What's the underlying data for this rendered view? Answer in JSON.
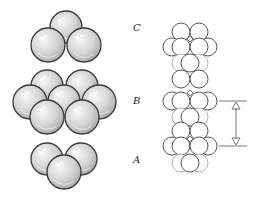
{
  "diagram": {
    "type": "close-packed sphere stacking",
    "layers": [
      {
        "label": "C",
        "sphere_count": 3
      },
      {
        "label": "B",
        "sphere_count": 7
      },
      {
        "label": "A",
        "sphere_count": 3
      }
    ],
    "labels": {
      "c": "C",
      "b": "B",
      "a": "A"
    },
    "colors": {
      "sphere_fill_light": "#f4f4f4",
      "sphere_fill_dark": "#b9b9b9",
      "sphere_stroke": "#3a3a3a",
      "column_stroke": "#444444",
      "background": "#ffffff"
    },
    "spheres": {
      "layer_c": [
        {
          "cx": 66,
          "cy": 27,
          "r": 16
        },
        {
          "cx": 48,
          "cy": 45,
          "r": 17
        },
        {
          "cx": 84,
          "cy": 45,
          "r": 17
        }
      ],
      "layer_b": [
        {
          "cx": 47,
          "cy": 86,
          "r": 16
        },
        {
          "cx": 82,
          "cy": 86,
          "r": 16
        },
        {
          "cx": 30,
          "cy": 102,
          "r": 17
        },
        {
          "cx": 64,
          "cy": 101,
          "r": 16
        },
        {
          "cx": 99,
          "cy": 102,
          "r": 17
        },
        {
          "cx": 47,
          "cy": 117,
          "r": 17
        },
        {
          "cx": 82,
          "cy": 117,
          "r": 17
        }
      ],
      "layer_a": [
        {
          "cx": 47,
          "cy": 159,
          "r": 16
        },
        {
          "cx": 81,
          "cy": 159,
          "r": 16
        },
        {
          "cx": 64,
          "cy": 172,
          "r": 17
        }
      ]
    },
    "side_view_column": {
      "rows": [
        {
          "y": 32,
          "xs": [
            181,
            199
          ],
          "r": 9,
          "faint": false
        },
        {
          "y": 47,
          "xs": [
            172,
            208
          ],
          "r": 9,
          "faint": false
        },
        {
          "y": 47,
          "xs": [
            181,
            199
          ],
          "r": 9,
          "faint": false
        },
        {
          "y": 63,
          "xs": [
            181,
            199
          ],
          "r": 9,
          "faint": true
        },
        {
          "y": 63,
          "xs": [
            190
          ],
          "r": 9,
          "faint": false
        },
        {
          "y": 79,
          "xs": [
            181,
            199
          ],
          "r": 9,
          "faint": false
        },
        {
          "y": 101,
          "xs": [
            172,
            208
          ],
          "r": 9,
          "faint": false
        },
        {
          "y": 101,
          "xs": [
            181,
            199
          ],
          "r": 9,
          "faint": false
        },
        {
          "y": 117,
          "xs": [
            181,
            199
          ],
          "r": 9,
          "faint": true
        },
        {
          "y": 117,
          "xs": [
            190
          ],
          "r": 9,
          "faint": false
        },
        {
          "y": 131,
          "xs": [
            181,
            199
          ],
          "r": 9,
          "faint": false
        },
        {
          "y": 146,
          "xs": [
            172,
            208
          ],
          "r": 9,
          "faint": false
        },
        {
          "y": 146,
          "xs": [
            181,
            199
          ],
          "r": 9,
          "faint": false
        },
        {
          "y": 163,
          "xs": [
            181,
            199
          ],
          "r": 9,
          "faint": true
        },
        {
          "y": 163,
          "xs": [
            190
          ],
          "r": 9,
          "faint": false
        }
      ]
    },
    "repeat_distance_marker": {
      "x": 236,
      "y_top": 101,
      "y_bottom": 146
    }
  }
}
